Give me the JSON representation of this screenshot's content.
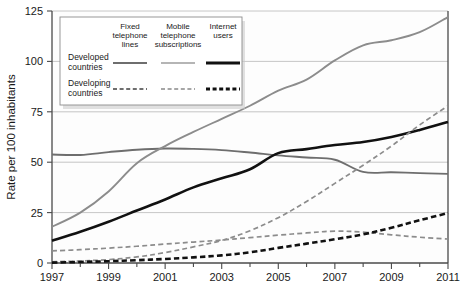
{
  "chart_data": {
    "type": "line",
    "title": "",
    "xlabel": "",
    "ylabel": "Rate per 100 inhabitants",
    "xlim": [
      1997,
      2011
    ],
    "ylim": [
      0,
      125
    ],
    "yticks": [
      0,
      25,
      50,
      75,
      100,
      125
    ],
    "ytick_labels": [
      "0",
      "25",
      "50",
      "75",
      "100",
      "125"
    ],
    "xticks": [
      1997,
      1999,
      2001,
      2003,
      2005,
      2007,
      2009,
      2011
    ],
    "xtick_labels": [
      "1997",
      "1999",
      "2001",
      "2003",
      "2005",
      "2007",
      "2009",
      "2011"
    ],
    "xminor_ticks": [
      1998,
      2000,
      2002,
      2004,
      2006,
      2008,
      2010
    ],
    "grid": "horizontal",
    "legend_position": "top-left",
    "x": [
      1997,
      1998,
      1999,
      2000,
      2001,
      2002,
      2003,
      2004,
      2005,
      2006,
      2007,
      2008,
      2009,
      2010,
      2011
    ],
    "series": [
      {
        "name": "Fixed telephone lines – Developed countries",
        "group": "Developed countries",
        "category": "Fixed telephone lines",
        "color": "#6e6e6e",
        "style": "solid",
        "width": 1.9,
        "values": [
          53.8,
          53.6,
          55.0,
          56.2,
          56.8,
          56.6,
          56.0,
          54.8,
          53.4,
          52.3,
          51.2,
          45.2,
          45.0,
          44.6,
          44.2
        ]
      },
      {
        "name": "Mobile telephone subscriptions – Developed countries",
        "group": "Developed countries",
        "category": "Mobile telephone subscriptions",
        "color": "#8c8c8c",
        "style": "solid",
        "width": 1.9,
        "values": [
          18.0,
          25.0,
          35.5,
          49.5,
          58.0,
          65.0,
          71.5,
          78.0,
          85.5,
          91.0,
          100.5,
          108.0,
          110.5,
          114.5,
          122.0
        ]
      },
      {
        "name": "Internet users – Developed countries",
        "group": "Developed countries",
        "category": "Internet users",
        "color": "#111111",
        "style": "solid",
        "width": 2.6,
        "values": [
          11.0,
          15.5,
          20.5,
          26.0,
          31.5,
          37.5,
          42.0,
          46.5,
          54.5,
          56.5,
          58.5,
          60.0,
          62.5,
          66.0,
          70.0
        ]
      },
      {
        "name": "Fixed telephone lines – Developing countries",
        "group": "Developing countries",
        "category": "Fixed telephone lines",
        "color": "#8c8c8c",
        "style": "dashed",
        "width": 1.7,
        "dash": "5,3.2",
        "values": [
          6.0,
          6.6,
          7.4,
          8.3,
          9.4,
          10.4,
          11.4,
          12.6,
          13.8,
          14.9,
          15.8,
          15.3,
          14.0,
          12.8,
          11.9
        ]
      },
      {
        "name": "Mobile telephone subscriptions – Developing countries",
        "group": "Developing countries",
        "category": "Mobile telephone subscriptions",
        "color": "#8c8c8c",
        "style": "dashed",
        "width": 1.7,
        "dash": "5,3.2",
        "values": [
          0.6,
          1.0,
          1.7,
          3.0,
          5.2,
          8.0,
          11.2,
          16.0,
          22.5,
          30.5,
          39.5,
          48.5,
          58.0,
          68.5,
          78.0
        ]
      },
      {
        "name": "Internet users – Developing countries",
        "group": "Developing countries",
        "category": "Internet users",
        "color": "#111111",
        "style": "dashed",
        "width": 2.6,
        "dash": "5.5,3.2",
        "values": [
          0.2,
          0.5,
          0.9,
          1.4,
          2.0,
          2.8,
          3.8,
          5.3,
          7.5,
          9.6,
          11.8,
          14.2,
          17.5,
          21.2,
          24.8
        ]
      }
    ]
  },
  "legend": {
    "columns": [
      {
        "label_lines": [
          "Fixed",
          "telephone",
          "lines"
        ],
        "key": "fixed-telephone-lines"
      },
      {
        "label_lines": [
          "Mobile",
          "telephone",
          "subscriptions"
        ],
        "key": "mobile-telephone-subscriptions"
      },
      {
        "label_lines": [
          "Internet",
          "users"
        ],
        "key": "internet-users"
      }
    ],
    "rows": [
      {
        "label_lines": [
          "Developed",
          "countries"
        ],
        "key": "developed-countries",
        "style": "solid"
      },
      {
        "label_lines": [
          "Developing",
          "countries"
        ],
        "key": "developing-countries",
        "style": "dashed"
      }
    ],
    "swatches": [
      {
        "row": "developed-countries",
        "column": "fixed-telephone-lines",
        "color": "#6e6e6e",
        "style": "solid",
        "width": 1.9
      },
      {
        "row": "developed-countries",
        "column": "mobile-telephone-subscriptions",
        "color": "#9d9d9d",
        "style": "solid",
        "width": 1.7
      },
      {
        "row": "developed-countries",
        "column": "internet-users",
        "color": "#111111",
        "style": "solid",
        "width": 2.8
      },
      {
        "row": "developing-countries",
        "column": "fixed-telephone-lines",
        "color": "#6e6e6e",
        "style": "dashed",
        "width": 1.8
      },
      {
        "row": "developing-countries",
        "column": "mobile-telephone-subscriptions",
        "color": "#a6a6a6",
        "style": "dashed",
        "width": 1.8
      },
      {
        "row": "developing-countries",
        "column": "internet-users",
        "color": "#111111",
        "style": "dashed",
        "width": 3.0
      }
    ]
  },
  "colors": {
    "fixed_developed": "#6e6e6e",
    "mobile_developed": "#8c8c8c",
    "internet_developed": "#111111",
    "grid": "#b8b8b8",
    "axis": "#4a4a4a",
    "legend_border": "#8d8d8d",
    "background": "#ffffff"
  }
}
